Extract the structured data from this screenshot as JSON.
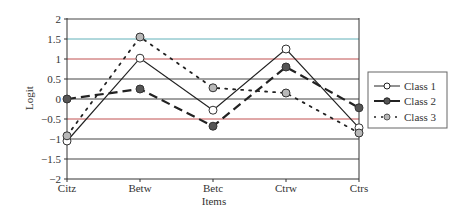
{
  "chart_data": {
    "type": "line",
    "title": "",
    "xlabel": "Items",
    "ylabel": "Logit",
    "categories": [
      "Citz",
      "Betw",
      "Betc",
      "Ctrw",
      "Ctrs"
    ],
    "ylim": [
      -2,
      2
    ],
    "yticks": [
      2,
      1.5,
      1,
      0.5,
      0,
      -0.5,
      -1,
      -1.5,
      -2
    ],
    "ytick_labels": [
      "2",
      "1.5",
      "1",
      "0.5",
      "0",
      "−0.5",
      "−1",
      "−1.5",
      "−2"
    ],
    "grid": true,
    "legend_position": "right",
    "series": [
      {
        "name": "Class 1",
        "values": [
          -1.05,
          1.02,
          -0.28,
          1.25,
          -0.72
        ],
        "line": "solid-thin",
        "marker": "open-circle",
        "marker_fill": "#ffffff"
      },
      {
        "name": "Class 2",
        "values": [
          0.0,
          0.25,
          -0.68,
          0.8,
          -0.22
        ],
        "line": "dashed-thick",
        "marker": "filled-circle",
        "marker_fill": "#555555"
      },
      {
        "name": "Class 3",
        "values": [
          -0.92,
          1.55,
          0.28,
          0.15,
          -0.85
        ],
        "line": "dotted",
        "marker": "gray-circle",
        "marker_fill": "#b8b8b8"
      }
    ]
  },
  "legend": {
    "items": [
      "Class 1",
      "Class 2",
      "Class 3"
    ]
  },
  "colors": {
    "gridline": "#444444",
    "gridline_red": "#c05050",
    "gridline_cyan": "#60b0b8",
    "axis": "#333333"
  }
}
